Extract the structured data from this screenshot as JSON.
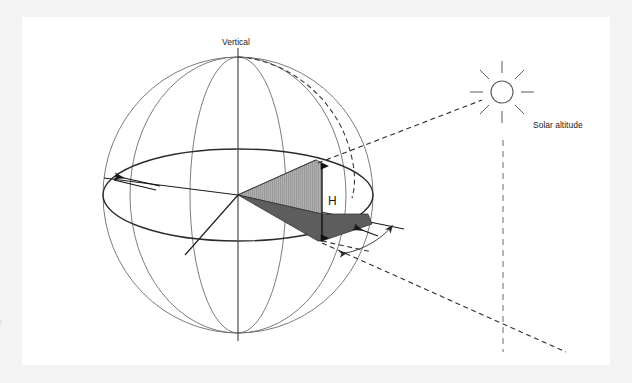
{
  "figure": {
    "title_alt": "Celestial sphere diagram showing solar altitude and sun path",
    "background_color": "#f3f3f3",
    "sheet_color": "#ffffff"
  },
  "labels": {
    "vertical": "Vertical",
    "solar_altitude": "Solar altitude",
    "height_symbol": "H",
    "edge_fragment": "r"
  },
  "colors": {
    "sheet": "#ffffff",
    "page_surround": "#f3f3f3",
    "sphere_outline": "#6d6d6d",
    "horizon_line": "#2b2b2b",
    "triangle_light": "#a8a8a8",
    "triangle_dark": "#5d5d5d",
    "dashed_ray": "#2e2e2e",
    "plumb_dashed": "#8d8d8d",
    "sun_stroke": "#5a5a5a",
    "text": "#1b1b1b"
  },
  "geometry": {
    "sphere": {
      "center_x": 238,
      "center_y": 195,
      "radius_x": 135,
      "radius_y": 138
    },
    "horizon_ellipse": {
      "center_x": 238,
      "center_y": 195,
      "radius_x": 135,
      "radius_y": 46
    },
    "vertical_axis": {
      "x": 238,
      "y_top": 48,
      "y_bottom": 341
    },
    "sun": {
      "center_x": 502,
      "center_y": 92,
      "radius": 11,
      "ray_count": 8
    },
    "plumb_line": {
      "x": 503,
      "y_top": 140,
      "y_bottom": 352
    },
    "height_dimension": {
      "x": 322,
      "y_top": 163,
      "y_bottom": 241
    }
  },
  "elements": {
    "sun_icon_name": "sun-icon",
    "vertical_axis_name": "vertical-axis",
    "horizon_name": "horizon-ellipse",
    "shaded_upper_name": "shaded-triangle-upper",
    "shaded_lower_name": "shaded-triangle-lower"
  }
}
